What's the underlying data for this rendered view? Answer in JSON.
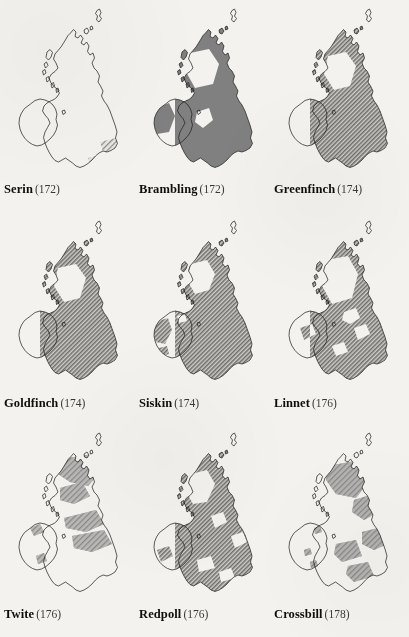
{
  "page": {
    "background_color": "#f4f2ee",
    "ink_color": "#100e0c",
    "fill_color": "#808080",
    "outline_color": "#1a1a1a",
    "columns": 3,
    "rows": 3
  },
  "maps": [
    {
      "species": "Serin",
      "page_ref": "(172)",
      "page_number": 172,
      "fill_style": "outline-only",
      "coverage": "very-sparse",
      "region_note": "tiny hatched patch in south-east England only"
    },
    {
      "species": "Brambling",
      "page_ref": "(172)",
      "page_number": 172,
      "fill_style": "solid-grey",
      "coverage": "widespread",
      "region_note": "solid grey over most of Britain and Ireland, gaps in north-west Scotland and western Ireland"
    },
    {
      "species": "Greenfinch",
      "page_ref": "(174)",
      "page_number": 174,
      "fill_style": "hatched",
      "coverage": "near-complete",
      "region_note": "hatched across nearly all of Britain and Ireland, gap in north-west Scottish Highlands"
    },
    {
      "species": "Goldfinch",
      "page_ref": "(174)",
      "page_number": 174,
      "fill_style": "hatched",
      "coverage": "near-complete",
      "region_note": "hatched throughout, small gaps in north-west Scotland and north-west Ireland"
    },
    {
      "species": "Siskin",
      "page_ref": "(174)",
      "page_number": 174,
      "fill_style": "hatched",
      "coverage": "widespread-patchy",
      "region_note": "patchy in western and central Ireland, continuous in Scotland and England"
    },
    {
      "species": "Linnet",
      "page_ref": "(176)",
      "page_number": 176,
      "fill_style": "hatched",
      "coverage": "near-complete",
      "region_note": "hatched throughout, notable gap over north-west Scottish Highlands"
    },
    {
      "species": "Twite",
      "page_ref": "(176)",
      "page_number": 176,
      "fill_style": "mixed-hatched",
      "coverage": "sparse",
      "region_note": "bands across northern Scotland and the Pennines, largely absent from Ireland and southern England"
    },
    {
      "species": "Redpoll",
      "page_ref": "(176)",
      "page_number": 176,
      "fill_style": "hatched",
      "coverage": "widespread",
      "region_note": "hatched across most of Britain and Ireland with scattered gaps"
    },
    {
      "species": "Crossbill",
      "page_ref": "(178)",
      "page_number": 178,
      "fill_style": "hatched",
      "coverage": "patchy",
      "region_note": "scattered patches in Scotland, East Anglia and southern England; largely absent from Ireland"
    }
  ]
}
